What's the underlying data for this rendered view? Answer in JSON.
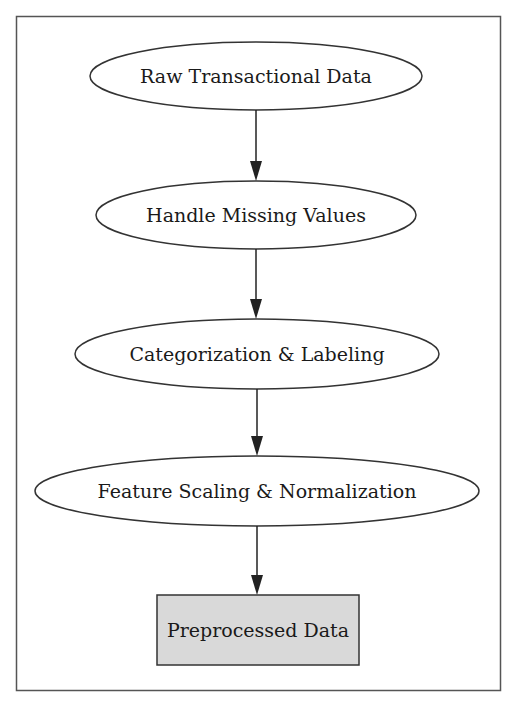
{
  "diagram": {
    "type": "flowchart",
    "direction": "top-to-bottom",
    "colors": {
      "frame": "#555555",
      "node_stroke": "#333333",
      "node_fill": "#ffffff",
      "terminal_fill": "#d9d9d9",
      "edge": "#222222",
      "text": "#1a1a1a"
    },
    "nodes": [
      {
        "id": "raw",
        "label": "Raw Transactional Data",
        "shape": "ellipse"
      },
      {
        "id": "missing",
        "label": "Handle Missing Values",
        "shape": "ellipse"
      },
      {
        "id": "categorize",
        "label": "Categorization & Labeling",
        "shape": "ellipse"
      },
      {
        "id": "scaling",
        "label": "Feature Scaling & Normalization",
        "shape": "ellipse"
      },
      {
        "id": "preprocessed",
        "label": "Preprocessed Data",
        "shape": "box"
      }
    ],
    "edges": [
      {
        "from": "raw",
        "to": "missing"
      },
      {
        "from": "missing",
        "to": "categorize"
      },
      {
        "from": "categorize",
        "to": "scaling"
      },
      {
        "from": "scaling",
        "to": "preprocessed"
      }
    ]
  }
}
